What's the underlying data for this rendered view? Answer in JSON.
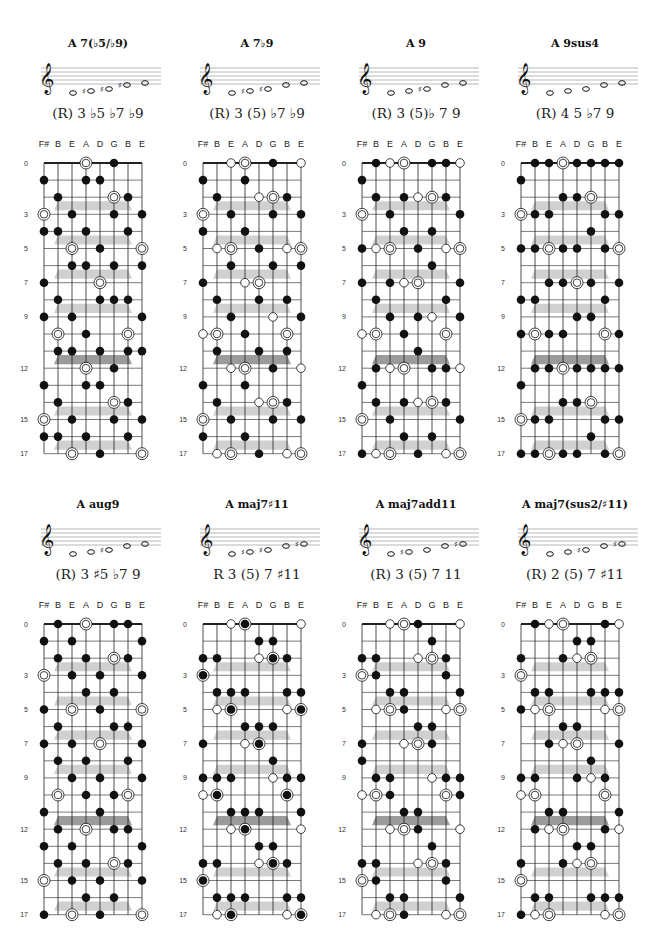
{
  "tuning": {
    "labels": [
      "F#",
      "B",
      "E",
      "A",
      "D",
      "G",
      "B",
      "E"
    ],
    "pitch_classes": [
      6,
      11,
      4,
      9,
      2,
      7,
      11,
      4
    ]
  },
  "fret_labels": [
    "0",
    "3",
    "5",
    "7",
    "9",
    "12",
    "15",
    "17"
  ],
  "fret_label_positions": [
    0,
    3,
    5,
    7,
    9,
    12,
    15,
    17
  ],
  "max_fret": 17,
  "root_pitch_class": 9,
  "legend": {
    "root": "double-circle",
    "chord_tone": "filled-dot",
    "optional_tone": "hollow-circle",
    "root_filled": "filled-dot-ringed"
  },
  "colors": {
    "ink": "#111111",
    "grid": "#222222",
    "band_light": "#c8c8c8",
    "band_dark": "#8a8a8a",
    "staff_line": "#888888"
  },
  "chords": [
    {
      "title": "A 7(♭5/♭9)",
      "formula": "(R) 3 ♭5 ♭7 ♭9",
      "staff_notes": [
        "A",
        "C#",
        "D#",
        "G#/A♭",
        "B♭"
      ],
      "staff_accidentals": [
        "",
        "♯",
        "♯",
        "♯",
        ""
      ],
      "root_style": "ring",
      "tones": [
        {
          "interval": 4,
          "style": "dot"
        },
        {
          "interval": 6,
          "style": "dot"
        },
        {
          "interval": 10,
          "style": "dot"
        },
        {
          "interval": 1,
          "style": "dot"
        }
      ]
    },
    {
      "title": "A 7♭9",
      "formula": "(R) 3 (5) ♭7 ♭9",
      "staff_notes": [
        "A",
        "C#",
        "E",
        "G",
        "B♭"
      ],
      "staff_accidentals": [
        "",
        "♯",
        "♯",
        "",
        ""
      ],
      "root_style": "ring",
      "tones": [
        {
          "interval": 4,
          "style": "dot"
        },
        {
          "interval": 7,
          "style": "open"
        },
        {
          "interval": 10,
          "style": "dot"
        },
        {
          "interval": 1,
          "style": "dot"
        }
      ]
    },
    {
      "title": "A 9",
      "formula": "(R) 3 (5)♭ 7 9",
      "staff_notes": [
        "A",
        "C#",
        "E",
        "G",
        "B"
      ],
      "staff_accidentals": [
        "",
        "",
        "♯",
        "",
        ""
      ],
      "root_style": "ring",
      "tones": [
        {
          "interval": 4,
          "style": "dot"
        },
        {
          "interval": 7,
          "style": "open"
        },
        {
          "interval": 10,
          "style": "dot"
        },
        {
          "interval": 2,
          "style": "dot"
        }
      ]
    },
    {
      "title": "A 9sus4",
      "formula": "(R) 4 5 ♭7 9",
      "staff_notes": [
        "A",
        "D",
        "E",
        "G",
        "B"
      ],
      "staff_accidentals": [
        "",
        "",
        "",
        "",
        ""
      ],
      "root_style": "ring",
      "tones": [
        {
          "interval": 5,
          "style": "dot"
        },
        {
          "interval": 7,
          "style": "dot"
        },
        {
          "interval": 10,
          "style": "dot"
        },
        {
          "interval": 2,
          "style": "dot"
        }
      ]
    },
    {
      "title": "A aug9",
      "formula": "(R) 3 ♯5 ♭7 9",
      "staff_notes": [
        "A",
        "C#",
        "E#",
        "G",
        "B"
      ],
      "staff_accidentals": [
        "",
        "",
        "♯",
        "",
        ""
      ],
      "root_style": "ring",
      "tones": [
        {
          "interval": 4,
          "style": "dot"
        },
        {
          "interval": 8,
          "style": "dot"
        },
        {
          "interval": 10,
          "style": "dot"
        },
        {
          "interval": 2,
          "style": "dot"
        }
      ]
    },
    {
      "title": "A maj7♯11",
      "formula": "R 3 (5) 7 ♯11",
      "staff_notes": [
        "A",
        "C#",
        "E",
        "G#",
        "D#"
      ],
      "staff_accidentals": [
        "",
        "♯",
        "♯",
        "",
        "♯"
      ],
      "root_style": "filled-ring",
      "tones": [
        {
          "interval": 4,
          "style": "dot"
        },
        {
          "interval": 7,
          "style": "open"
        },
        {
          "interval": 11,
          "style": "dot"
        },
        {
          "interval": 6,
          "style": "dot"
        }
      ]
    },
    {
      "title": "A maj7add11",
      "formula": "(R) 3 (5) 7 11",
      "staff_notes": [
        "A",
        "C#",
        "E",
        "G#",
        "D"
      ],
      "staff_accidentals": [
        "",
        "♯",
        "",
        "",
        "♯"
      ],
      "root_style": "ring",
      "tones": [
        {
          "interval": 4,
          "style": "dot"
        },
        {
          "interval": 7,
          "style": "open"
        },
        {
          "interval": 11,
          "style": "dot"
        },
        {
          "interval": 5,
          "style": "dot"
        }
      ]
    },
    {
      "title": "A maj7(sus2/♯11)",
      "formula": "(R) 2 (5) 7 ♯11",
      "staff_notes": [
        "A",
        "B",
        "E",
        "G#",
        "D#"
      ],
      "staff_accidentals": [
        "",
        "",
        "♯",
        "",
        "♯"
      ],
      "root_style": "ring",
      "tones": [
        {
          "interval": 2,
          "style": "dot"
        },
        {
          "interval": 7,
          "style": "open"
        },
        {
          "interval": 11,
          "style": "dot"
        },
        {
          "interval": 6,
          "style": "dot"
        }
      ]
    }
  ]
}
